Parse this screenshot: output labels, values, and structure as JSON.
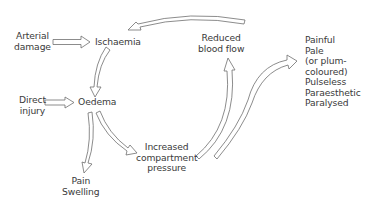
{
  "diagram": {
    "type": "flow-cycle",
    "nodes": {
      "arterial_damage": [
        "Arterial",
        "damage"
      ],
      "ischaemia": "Ischaemia",
      "direct_injury": [
        "Direct",
        "injury"
      ],
      "oedema": "Oedema",
      "pain_swelling": [
        "Pain",
        "Swelling"
      ],
      "increased_compartment_pressure": [
        "Increased",
        "compartment",
        "pressure"
      ],
      "reduced_blood_flow": [
        "Reduced",
        "blood flow"
      ],
      "symptoms": [
        "Painful",
        "Pale",
        "(or plum-",
        "coloured)",
        "Pulseless",
        "Paraesthetic",
        "Paralysed"
      ]
    },
    "edges": [
      {
        "from": "Arterial damage",
        "to": "Ischaemia"
      },
      {
        "from": "Ischaemia",
        "to": "Oedema"
      },
      {
        "from": "Direct injury",
        "to": "Oedema"
      },
      {
        "from": "Oedema",
        "to": "Pain / Swelling"
      },
      {
        "from": "Oedema",
        "to": "Increased compartment pressure"
      },
      {
        "from": "Increased compartment pressure",
        "to": "Reduced blood flow"
      },
      {
        "from": "Reduced blood flow",
        "to": "Ischaemia"
      },
      {
        "from": "Increased compartment pressure",
        "to": "Symptoms"
      }
    ]
  }
}
